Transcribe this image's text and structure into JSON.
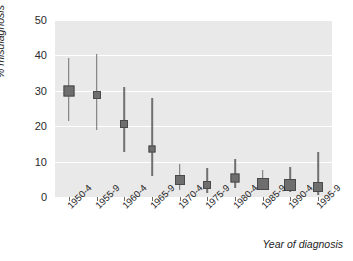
{
  "chart_data": {
    "type": "scatter",
    "title": "",
    "xlabel": "Year of diagnosis",
    "ylabel": "% misdiagnosis",
    "xlim": [
      0,
      10
    ],
    "ylim": [
      0,
      50
    ],
    "yticks": [
      0,
      10,
      20,
      30,
      40,
      50
    ],
    "grid": true,
    "legend": "none",
    "categories": [
      "1950-4",
      "1955-9",
      "1960-4",
      "1965-9",
      "1970-4",
      "1975-9",
      "1980-4",
      "1985-9",
      "1990-4",
      "1995-9"
    ],
    "values": [
      30.0,
      28.8,
      20.5,
      13.5,
      4.9,
      3.4,
      5.4,
      3.8,
      3.5,
      2.8
    ],
    "ci_low": [
      21.6,
      18.9,
      12.6,
      5.9,
      1.9,
      1.1,
      2.4,
      1.9,
      1.4,
      0.7
    ],
    "ci_high": [
      39.4,
      40.3,
      31.2,
      28.1,
      9.2,
      8.2,
      10.6,
      7.7,
      8.4,
      12.6
    ],
    "series": [
      {
        "name": "% misdiagnosis",
        "points": [
          {
            "category": "1950-4",
            "value": 30.0,
            "ci_low": 21.6,
            "ci_high": 39.4,
            "marker_size": 9
          },
          {
            "category": "1955-9",
            "value": 28.8,
            "ci_low": 18.9,
            "ci_high": 40.3,
            "marker_size": 6
          },
          {
            "category": "1960-4",
            "value": 20.5,
            "ci_low": 12.6,
            "ci_high": 31.2,
            "marker_size": 6
          },
          {
            "category": "1965-9",
            "value": 13.5,
            "ci_low": 5.9,
            "ci_high": 28.1,
            "marker_size": 5
          },
          {
            "category": "1970-4",
            "value": 4.9,
            "ci_low": 1.9,
            "ci_high": 9.2,
            "marker_size": 8
          },
          {
            "category": "1975-9",
            "value": 3.4,
            "ci_low": 1.1,
            "ci_high": 8.2,
            "marker_size": 6
          },
          {
            "category": "1980-4",
            "value": 5.4,
            "ci_low": 2.4,
            "ci_high": 10.6,
            "marker_size": 7
          },
          {
            "category": "1985-9",
            "value": 3.8,
            "ci_low": 1.9,
            "ci_high": 7.7,
            "marker_size": 10
          },
          {
            "category": "1990-4",
            "value": 3.5,
            "ci_low": 1.4,
            "ci_high": 8.4,
            "marker_size": 10
          },
          {
            "category": "1995-9",
            "value": 2.8,
            "ci_low": 0.7,
            "ci_high": 12.6,
            "marker_size": 8
          }
        ]
      }
    ],
    "colors": {
      "panel_background": "#e9e9e9",
      "gridline": "#ffffff",
      "marker": "#6e6e6e",
      "marker_edge": "#4a4a4a",
      "errorbar": "#707070",
      "text": "#1d1d1d",
      "figure_background": "#ffffff"
    }
  }
}
